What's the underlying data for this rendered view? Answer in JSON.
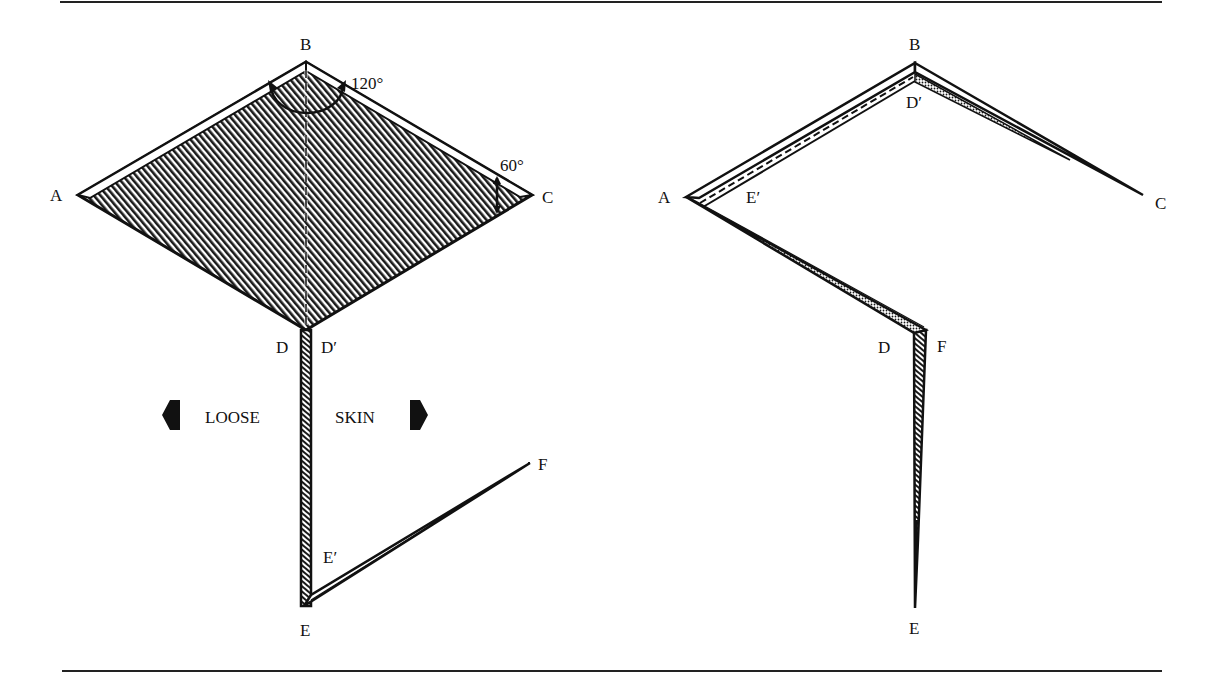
{
  "colors": {
    "ink": "#111111",
    "paper": "#ffffff",
    "hatch": "#1a1a1a"
  },
  "left_figure": {
    "description": "Rhombus of hatched skin with 120° angle at B and 60° angle at C; strip hanging from D to E, flap E' to F",
    "vertices": {
      "A": "A",
      "B": "B",
      "C": "C",
      "D": "D",
      "D_prime": "D′",
      "E": "E",
      "E_prime": "E′",
      "F": "F"
    },
    "angles": {
      "angle_B": "120°",
      "angle_C": "60°"
    },
    "annotation": {
      "left_word": "LOOSE",
      "right_word": "SKIN",
      "left_arrow": "arrow-left-icon",
      "right_arrow": "arrow-right-icon"
    }
  },
  "right_figure": {
    "description": "Result after transposition: skin edges rearranged into thin folded strips",
    "vertices": {
      "A": "A",
      "B": "B",
      "C": "C",
      "D": "D",
      "D_prime": "D′",
      "E": "E",
      "E_prime": "E′",
      "F": "F"
    }
  }
}
